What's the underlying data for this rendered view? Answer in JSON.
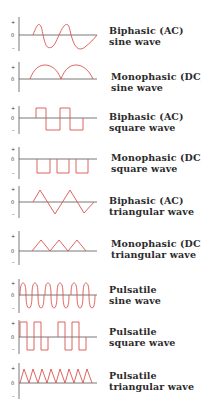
{
  "colors": {
    "wave": "#d9534f",
    "axis": "#555555",
    "text": "#2b2b2b"
  },
  "axis_labels": {
    "plus": "+",
    "zero": "0",
    "minus": "–"
  },
  "waveforms": [
    {
      "id": "biphasic-sine",
      "line1": "Biphasic (AC)",
      "line2": "sine wave"
    },
    {
      "id": "monophasic-sine",
      "line1": "Monophasic (DC)",
      "line2": "sine wave"
    },
    {
      "id": "biphasic-square",
      "line1": "Biphasic (AC)",
      "line2": "square wave"
    },
    {
      "id": "monophasic-square",
      "line1": "Monophasic (DC)",
      "line2": "square wave"
    },
    {
      "id": "biphasic-triangular",
      "line1": "Biphasic (AC)",
      "line2": "triangular wave"
    },
    {
      "id": "monophasic-triangular",
      "line1": "Monophasic (DC)",
      "line2": "triangular wave"
    },
    {
      "id": "pulsatile-sine",
      "line1": "Pulsatile",
      "line2": "sine wave"
    },
    {
      "id": "pulsatile-square",
      "line1": "Pulsatile",
      "line2": "square wave"
    },
    {
      "id": "pulsatile-triangular",
      "line1": "Pulsatile",
      "line2": "triangular wave"
    }
  ]
}
